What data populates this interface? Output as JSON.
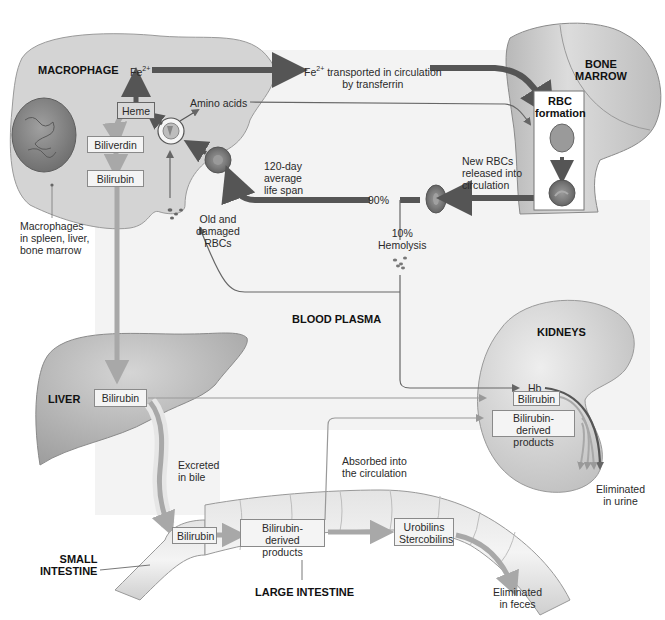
{
  "caption_fragment": "",
  "regions": {
    "macrophage": "MACROPHAGE",
    "bone_marrow": [
      "BONE",
      "MARROW"
    ],
    "blood_plasma": "BLOOD PLASMA",
    "kidneys": "KIDNEYS",
    "liver": "LIVER",
    "small_intestine": [
      "SMALL",
      "INTESTINE"
    ],
    "large_intestine": "LARGE INTESTINE"
  },
  "macrophage": {
    "fe": "Fe",
    "fe_charge": "2+",
    "heme": "Heme",
    "amino_acids": "Amino acids",
    "biliverdin": "Biliverdin",
    "bilirubin": "Bilirubin",
    "location_note": [
      "Macrophages",
      "in spleen, liver,",
      "bone marrow"
    ]
  },
  "transport": {
    "fe": "Fe",
    "fe_charge": "2+",
    "line1": " transported in circulation",
    "line2": "by transferrin"
  },
  "bone_marrow": {
    "rbc_formation": [
      "RBC",
      "formation"
    ],
    "new_rbcs": [
      "New RBCs",
      "released into",
      "circulation"
    ]
  },
  "circulation": {
    "lifespan": [
      "120-day",
      "average",
      "life span"
    ],
    "percent_90": "90%",
    "percent_10": "10%",
    "hemolysis": "Hemolysis",
    "old_rbcs": [
      "Old and",
      "damaged",
      "RBCs"
    ]
  },
  "liver": {
    "bilirubin": "Bilirubin",
    "excreted": [
      "Excreted",
      "in bile"
    ]
  },
  "intestine": {
    "bilirubin": "Bilirubin",
    "derived": [
      "Bilirubin-derived",
      "products"
    ],
    "urobilins": [
      "Urobilins",
      "Stercobilins"
    ],
    "absorbed": [
      "Absorbed into",
      "the circulation"
    ],
    "eliminated": [
      "Eliminated",
      "in feces"
    ]
  },
  "kidneys": {
    "hb": "Hb",
    "bilirubin": "Bilirubin",
    "derived": [
      "Bilirubin-derived",
      "products"
    ],
    "eliminated": [
      "Eliminated",
      "in urine"
    ]
  },
  "colors": {
    "plasma_bg": "#f3f3f3",
    "organ_fill": "#cfcfcf",
    "dark_arrow": "#555555",
    "light_arrow": "#a8a8a8",
    "line": "#666666"
  }
}
